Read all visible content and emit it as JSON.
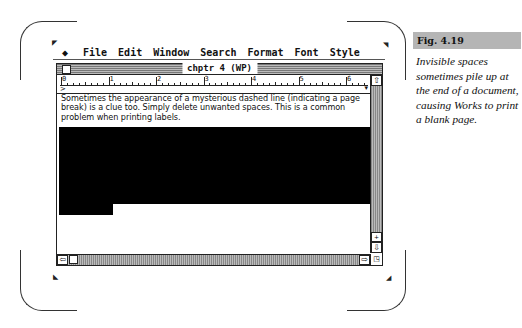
{
  "menubar": {
    "apple_icon": "apple-menu-icon",
    "items": [
      "File",
      "Edit",
      "Window",
      "Search",
      "Format",
      "Font",
      "Style"
    ]
  },
  "window": {
    "title": "chptr 4 (WP)",
    "ruler": {
      "labels": [
        "0",
        "1",
        "2",
        "3",
        "4",
        "5",
        "6"
      ]
    },
    "document": {
      "lines": [
        "Sometimes the appearance of a mysterious dashed line (indicating a page",
        "break) is a clue too. Simply delete unwanted spaces. This is a common",
        "problem when printing labels."
      ],
      "selection": "highlighted blank spaces (selected)"
    },
    "scrollbars": {
      "up_arrow": "⇧",
      "down_arrow": "⇩",
      "left_arrow": "⇦",
      "right_arrow": "⇨",
      "split_icon": "+"
    }
  },
  "caption": {
    "figure_label": "Fig. 4.19",
    "text": "Invisible spaces sometimes pile up at the end of a document, causing Works to print a blank page."
  },
  "colors": {
    "selection": "#000000",
    "caption_band": "#b5b5b5",
    "scrollbar_pattern": "#888888"
  }
}
